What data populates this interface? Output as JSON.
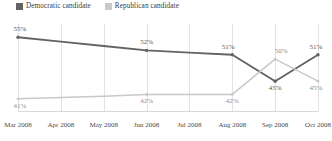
{
  "chart_data": {
    "type": "line",
    "title": "",
    "subtitle": "",
    "xlabel": "",
    "ylabel": "",
    "grid": "vertical-only",
    "legend_position": "top-left",
    "ylim": [
      38,
      58
    ],
    "categories": [
      "Mar 2008",
      "Apr 2008",
      "May 2008",
      "Jun 2008",
      "Jul 2008",
      "Aug 2008",
      "Sep 2008",
      "Oct 2008"
    ],
    "series": [
      {
        "name": "Democratic candidate",
        "color": "#63645f",
        "values": [
          55,
          54,
          53,
          52,
          51.5,
          51,
          45,
          51
        ],
        "labels": [
          {
            "index": 0,
            "text": "55%",
            "position": "above"
          },
          {
            "index": 3,
            "text": "52%",
            "position": "above"
          },
          {
            "index": 5,
            "text": "51%",
            "position": "above"
          },
          {
            "index": 6,
            "text": "45%",
            "position": "below"
          },
          {
            "index": 7,
            "text": "51%",
            "position": "above"
          }
        ]
      },
      {
        "name": "Republican candidate",
        "color": "#c8c8c4",
        "values": [
          41,
          41.3,
          41.6,
          42,
          42,
          42,
          50,
          45
        ],
        "labels": [
          {
            "index": 0,
            "text": "41%",
            "position": "below"
          },
          {
            "index": 3,
            "text": "42%",
            "position": "below"
          },
          {
            "index": 5,
            "text": "42%",
            "position": "below"
          },
          {
            "index": 6,
            "text": "50%",
            "position": "above"
          },
          {
            "index": 7,
            "text": "45%",
            "position": "below"
          }
        ]
      }
    ]
  },
  "legend": {
    "items": [
      {
        "label": "Democratic candidate",
        "color": "#63645f"
      },
      {
        "label": "Republican candidate",
        "color": "#c8c8c4"
      }
    ]
  },
  "axis": {
    "tick_labels": [
      "Mar 2008",
      "Apr 2008",
      "May 2008",
      "Jun 2008",
      "Jul 2008",
      "Aug 2008",
      "Sep 2008",
      "Oct 2008"
    ]
  }
}
